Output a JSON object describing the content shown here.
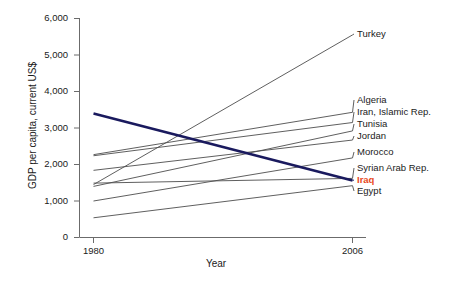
{
  "chart_data": {
    "type": "line",
    "title": "",
    "xlabel": "Year",
    "ylabel": "GDP per capita, current US$",
    "x": [
      1980,
      2006
    ],
    "xlim": [
      1980,
      2006
    ],
    "ylim": [
      0,
      6000
    ],
    "xticks": [
      "1980",
      "2006"
    ],
    "yticks": [
      "0",
      "1,000",
      "2,000",
      "3,000",
      "4,000",
      "5,000",
      "6,000"
    ],
    "grid": false,
    "legend_position": "right-of-plot-inline-labels",
    "series": [
      {
        "name": "Turkey",
        "values": [
          1450,
          5550
        ],
        "color": "#4d4d4d",
        "width": 0.9,
        "highlight": false
      },
      {
        "name": "Algeria",
        "values": [
          2270,
          3430
        ],
        "color": "#4d4d4d",
        "width": 0.9,
        "highlight": false
      },
      {
        "name": "Iran, Islamic Rep.",
        "values": [
          2240,
          3150
        ],
        "color": "#4d4d4d",
        "width": 0.9,
        "highlight": false
      },
      {
        "name": "Tunisia",
        "values": [
          1400,
          2920
        ],
        "color": "#4d4d4d",
        "width": 0.9,
        "highlight": false
      },
      {
        "name": "Jordan",
        "values": [
          1840,
          2670
        ],
        "color": "#4d4d4d",
        "width": 0.9,
        "highlight": false
      },
      {
        "name": "Morocco",
        "values": [
          1000,
          2180
        ],
        "color": "#4d4d4d",
        "width": 0.9,
        "highlight": false
      },
      {
        "name": "Syrian Arab Rep.",
        "values": [
          1490,
          1620
        ],
        "color": "#4d4d4d",
        "width": 0.9,
        "highlight": false
      },
      {
        "name": "Iraq",
        "values": [
          3400,
          1560
        ],
        "color": "#1a1a5e",
        "width": 2.6,
        "highlight": true
      },
      {
        "name": "Egypt",
        "values": [
          540,
          1420
        ],
        "color": "#4d4d4d",
        "width": 0.9,
        "highlight": false
      }
    ]
  },
  "axis": {
    "x_title": "Year",
    "y_title": "GDP per capita, current US$"
  }
}
